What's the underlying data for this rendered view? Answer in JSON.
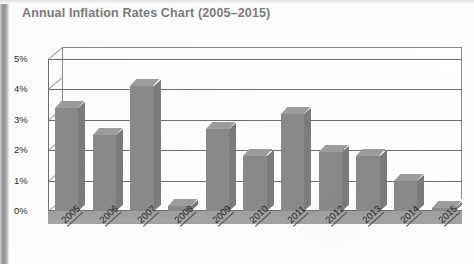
{
  "document": {
    "title": "Annual Inflation Rates Chart (2005–2015)",
    "scan_edge": "left-dark-edge"
  },
  "chart_data": {
    "type": "bar",
    "title": "Annual Inflation Rates Chart (2005–2015)",
    "xlabel": "",
    "ylabel": "",
    "categories": [
      "2005",
      "2006",
      "2007",
      "2008",
      "2009",
      "2010",
      "2011",
      "2012",
      "2013",
      "2014",
      "2015"
    ],
    "values": [
      3.4,
      2.5,
      4.1,
      0.15,
      2.7,
      1.8,
      3.2,
      1.95,
      1.8,
      1.0,
      0.1
    ],
    "value_labels": [
      "3.4%",
      "2.5%",
      "4.1%",
      "0.2%",
      "2.7%",
      "1.8%",
      "3.2%",
      "2.0%",
      "1.8%",
      "1.0%",
      "0.1%"
    ],
    "ylim": [
      0,
      5
    ],
    "ytick_values": [
      0,
      1,
      2,
      3,
      4,
      5
    ],
    "ytick_labels": [
      "0%",
      "1%",
      "2%",
      "3%",
      "4%",
      "5%"
    ],
    "grid": true,
    "grid_axis": "y",
    "legend": false,
    "legend_position": "none",
    "style": "3d-bar",
    "series_color": "#8a8a8a",
    "series_top_color": "#9d9d9d",
    "series_side_color": "#7c7c7c",
    "axis_color": "#6f6f6f",
    "title_color": "#7b7b7b",
    "background": "#ffffff"
  }
}
